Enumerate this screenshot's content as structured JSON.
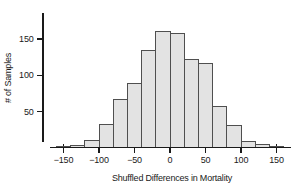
{
  "figure": {
    "background": "#ffffff",
    "width": 297,
    "height": 193
  },
  "chart_data": {
    "type": "bar",
    "subtype": "histogram",
    "title": "",
    "xlabel": "Shuffled Differences in Mortality",
    "ylabel": "# of Samples",
    "bin_start": -160,
    "bin_width": 20,
    "bin_edges": [
      -160,
      -140,
      -120,
      -100,
      -80,
      -60,
      -40,
      -20,
      0,
      20,
      40,
      60,
      80,
      100,
      120,
      140,
      160
    ],
    "values": [
      2,
      3,
      10,
      32,
      66,
      89,
      134,
      161,
      157,
      121,
      116,
      56,
      30,
      8,
      4,
      2
    ],
    "x_ticks": [
      -150,
      -100,
      -50,
      0,
      50,
      100,
      150
    ],
    "x_tick_labels": [
      "−150",
      "−100",
      "−50",
      "0",
      "50",
      "100",
      "150"
    ],
    "y_ticks": [
      50,
      100,
      150
    ],
    "y_tick_labels": [
      "50",
      "100",
      "150"
    ],
    "xlim": [
      -170,
      170
    ],
    "ylim": [
      0,
      186
    ],
    "grid": false,
    "legend": null,
    "bar_fill": "#e3e3e3",
    "bar_stroke": "#4f4f4f",
    "axis_color": "#1a1a1a",
    "text_color": "#1a1a1a"
  }
}
